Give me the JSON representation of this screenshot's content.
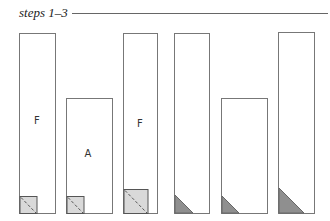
{
  "title": "steps 1–3",
  "colors": {
    "stroke": "#777777",
    "square_fill": "#d9d9d9",
    "triangle_fill": "#8f8f8f",
    "dash": "#555555"
  },
  "rects": [
    {
      "x": 19,
      "y": 33,
      "w": 36,
      "h": 180,
      "label": "F",
      "lx": 37,
      "ly": 124,
      "corner": "square",
      "size": 17
    },
    {
      "x": 66,
      "y": 98,
      "w": 46,
      "h": 115,
      "label": "A",
      "lx": 88,
      "ly": 157,
      "corner": "square",
      "size": 17
    },
    {
      "x": 123,
      "y": 33,
      "w": 34,
      "h": 180,
      "label": "F",
      "lx": 140,
      "ly": 127,
      "corner": "square",
      "size": 24
    },
    {
      "x": 174,
      "y": 33,
      "w": 35,
      "h": 180,
      "label": "",
      "corner": "triangle",
      "size": 18
    },
    {
      "x": 221,
      "y": 98,
      "w": 46,
      "h": 115,
      "label": "",
      "corner": "triangle",
      "size": 17
    },
    {
      "x": 278,
      "y": 32,
      "w": 36,
      "h": 181,
      "label": "",
      "corner": "triangle",
      "size": 25
    }
  ]
}
